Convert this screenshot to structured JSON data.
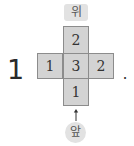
{
  "problem": {
    "number": "1",
    "terminator": "."
  },
  "labels": {
    "top": "위",
    "front": "앞"
  },
  "grid": {
    "top": "2",
    "left": "1",
    "center": "3",
    "right": "2",
    "bottom": "1"
  },
  "colors": {
    "cell_fill": "#d3d3d3",
    "cell_border": "#8c8c8c",
    "label_bg": "#e2e2e2"
  },
  "icons": {
    "front_arrow": "arrow-up-icon"
  }
}
